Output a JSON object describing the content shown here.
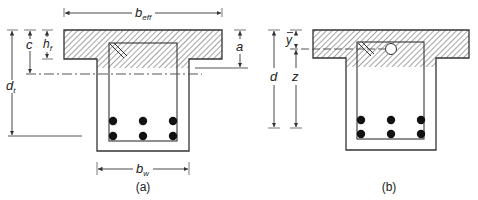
{
  "figure": {
    "panel_a": {
      "caption": "(a)",
      "labels": {
        "b_eff": {
          "main": "b",
          "sub": "eff"
        },
        "b_w": {
          "main": "b",
          "sub": "w"
        },
        "d_t": {
          "main": "d",
          "sub": "t"
        },
        "c": "c",
        "h_f": {
          "main": "h",
          "sub": "f"
        },
        "a": "a"
      },
      "reinforcement": {
        "rows": 2,
        "bars_per_row": 3
      }
    },
    "panel_b": {
      "caption": "(b)",
      "labels": {
        "d": "d",
        "z": "z",
        "y_bar": "y"
      },
      "reinforcement": {
        "rows": 2,
        "bars_per_row": 3
      }
    },
    "colors": {
      "line": "#333333",
      "hatch": "#555555",
      "bar": "#111111"
    }
  }
}
